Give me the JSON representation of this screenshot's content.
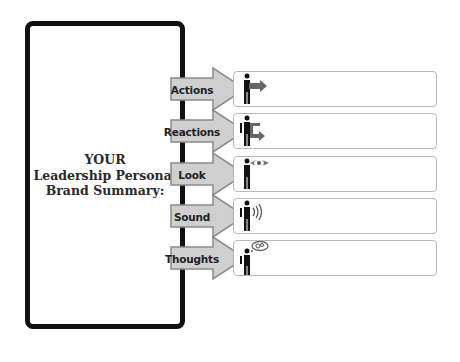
{
  "summary_panel": {
    "title_lines": [
      "YOUR",
      "Leadership Personal",
      "Brand Summary:"
    ]
  },
  "rows": [
    {
      "label": "Actions",
      "icon": "person-arrow-right-icon",
      "value": ""
    },
    {
      "label": "Reactions",
      "icon": "person-return-arrow-icon",
      "value": ""
    },
    {
      "label": "Look",
      "icon": "person-eye-icon",
      "value": ""
    },
    {
      "label": "Sound",
      "icon": "person-sound-waves-icon",
      "value": ""
    },
    {
      "label": "Thoughts",
      "icon": "person-thought-bubble-icon",
      "value": ""
    }
  ],
  "colors": {
    "panel_border": "#111111",
    "arrow_fill": "#cfcfcf",
    "arrow_stroke": "#8a8a8a",
    "box_border": "#b8b8b8"
  }
}
